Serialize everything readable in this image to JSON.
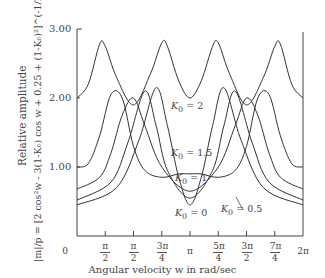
{
  "chart_data": {
    "type": "line",
    "title": "",
    "xlabel": "Angular velocity w in rad/sec",
    "ylabel": "Relative amplitude",
    "ylabel_formula": "|m|/p = [2 cos²w - 3(1-K₀) cos w + 0.25 + (1-K₀)²]^(-1/2)",
    "xlim": [
      "0",
      "2π"
    ],
    "ylim": [
      0,
      3.0
    ],
    "y_ticks": [
      "1.00",
      "2.00",
      "3.00"
    ],
    "x_ticks": [
      {
        "num": "0",
        "den": ""
      },
      {
        "num": "π",
        "den": "2"
      },
      {
        "num": "π",
        "den": "2"
      },
      {
        "num": "3π",
        "den": "4"
      },
      {
        "num": "π",
        "den": ""
      },
      {
        "num": "5π",
        "den": "4"
      },
      {
        "num": "3π",
        "den": "2"
      },
      {
        "num": "7π",
        "den": "4"
      },
      {
        "num": "2π",
        "den": ""
      }
    ],
    "x_fraction_of_pi": [
      0,
      0.25,
      0.5,
      0.75,
      1.0,
      1.25,
      1.5,
      1.75,
      2.0
    ],
    "series": [
      {
        "name": "K₀ = 2",
        "x_over_pi": [
          0,
          0.1,
          0.2,
          0.25,
          0.35,
          0.5,
          0.65,
          0.75,
          0.8,
          0.9,
          1.0,
          1.1,
          1.2,
          1.25,
          1.35,
          1.5,
          1.65,
          1.75,
          1.8,
          1.9,
          2.0
        ],
        "values": [
          2.0,
          2.2,
          2.78,
          2.75,
          2.3,
          1.9,
          2.35,
          2.8,
          2.75,
          2.25,
          2.0,
          2.25,
          2.75,
          2.8,
          2.35,
          1.9,
          2.3,
          2.75,
          2.78,
          2.2,
          2.0
        ]
      },
      {
        "name": "K₀ = 1.5",
        "x_over_pi": [
          0,
          0.1,
          0.2,
          0.3,
          0.4,
          0.5,
          0.6,
          0.75,
          0.9,
          1.0,
          1.1,
          1.25,
          1.4,
          1.5,
          1.6,
          1.7,
          1.8,
          1.9,
          2.0
        ],
        "values": [
          1.0,
          1.05,
          1.45,
          2.05,
          2.0,
          1.3,
          0.95,
          0.85,
          0.9,
          0.9,
          0.9,
          0.85,
          0.95,
          1.3,
          2.0,
          2.05,
          1.45,
          1.05,
          1.0
        ]
      },
      {
        "name": "K₀ = 1",
        "x_over_pi": [
          0,
          0.2,
          0.3,
          0.4,
          0.5,
          0.6,
          0.75,
          1.0,
          1.25,
          1.4,
          1.5,
          1.6,
          1.7,
          1.8,
          2.0
        ],
        "values": [
          0.68,
          0.85,
          1.2,
          1.75,
          2.0,
          1.6,
          1.0,
          0.65,
          1.0,
          1.6,
          2.0,
          1.75,
          1.2,
          0.85,
          0.68
        ]
      },
      {
        "name": "K₀ = 0.5",
        "x_over_pi": [
          0,
          0.3,
          0.45,
          0.6,
          0.7,
          0.8,
          1.0,
          1.2,
          1.3,
          1.4,
          1.55,
          1.7,
          2.0
        ],
        "values": [
          0.52,
          0.78,
          1.35,
          2.1,
          1.6,
          0.95,
          0.55,
          0.95,
          1.6,
          2.1,
          1.35,
          0.78,
          0.52
        ]
      },
      {
        "name": "K₀ = 0",
        "x_over_pi": [
          0,
          0.35,
          0.55,
          0.7,
          0.8,
          0.9,
          1.0,
          1.1,
          1.2,
          1.3,
          1.45,
          1.65,
          2.0
        ],
        "values": [
          0.45,
          0.7,
          1.4,
          2.15,
          1.6,
          0.85,
          0.45,
          0.85,
          1.6,
          2.15,
          1.4,
          0.7,
          0.45
        ]
      }
    ],
    "grid": false,
    "legend_position": "inline labels"
  },
  "labels": {
    "k2": "= 2",
    "k15": "= 1.5",
    "k1": "= 1",
    "k0": "= 0",
    "k05": "= 0.5",
    "kname": "K",
    "ksub": "0"
  }
}
